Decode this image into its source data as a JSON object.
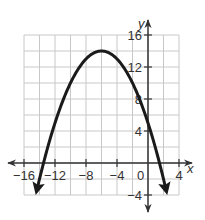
{
  "chart_data": {
    "type": "line",
    "title": "",
    "xlabel": "x",
    "ylabel": "y",
    "xlim": [
      -17,
      5
    ],
    "ylim": [
      -5,
      17
    ],
    "grid": true,
    "grid_step": 2,
    "x_ticks": [
      -16,
      -12,
      -8,
      -4,
      0,
      4
    ],
    "y_ticks": [
      -4,
      4,
      8,
      12,
      16
    ],
    "x_tick_labels": [
      "-16",
      "-12",
      "-8",
      "-4",
      "0",
      "4"
    ],
    "y_tick_labels": [
      "-4",
      "4",
      "8",
      "12",
      "16"
    ],
    "series": [
      {
        "name": "parabola",
        "equation": "y = -0.25(x + 6)^2 + 14",
        "vertex": [
          -6,
          14
        ],
        "x_intercepts": [
          -13.5,
          1.5
        ],
        "y_intercept": 5,
        "arrows_at_ends": true,
        "x": [
          -14.3,
          -13.5,
          -12,
          -10,
          -8,
          -6,
          -4,
          -2,
          0,
          1.5,
          2.3
        ],
        "values": [
          -3.2,
          0,
          5,
          10,
          13,
          14,
          13,
          10,
          5,
          0,
          -3.2
        ],
        "color": "#1a1a1a"
      }
    ],
    "legend": null
  },
  "labels": {
    "x_axis": "x",
    "y_axis": "y",
    "origin": "0"
  },
  "colors": {
    "grid": "#c8c8c8",
    "axis": "#333333",
    "curve": "#1a1a1a",
    "background": "#ffffff"
  }
}
